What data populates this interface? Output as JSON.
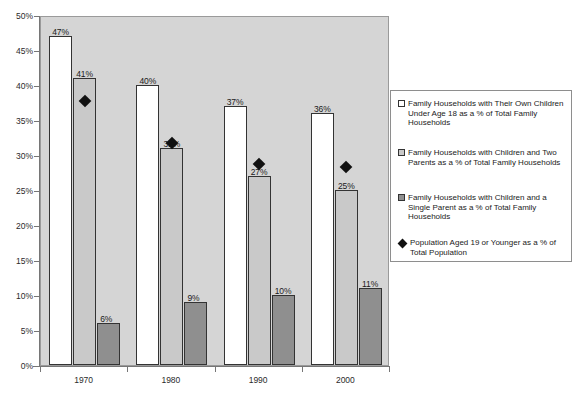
{
  "chart_data": {
    "type": "bar",
    "title": "",
    "subtitle": "",
    "xlabel": "",
    "ylabel": "",
    "categories": [
      "1970",
      "1980",
      "1990",
      "2000"
    ],
    "ylim": [
      0,
      50
    ],
    "y_tick_step": 5,
    "y_tick_labels": [
      "0%",
      "5%",
      "10%",
      "15%",
      "20%",
      "25%",
      "30%",
      "35%",
      "40%",
      "45%",
      "50%"
    ],
    "y_tick_values": [
      0,
      5,
      10,
      15,
      20,
      25,
      30,
      35,
      40,
      45,
      50
    ],
    "grid": false,
    "legend_position": "right",
    "plot_background": "#d5d5d5",
    "series": [
      {
        "name": "Family Households with Their Own Children Under Age 18 as a % of Total Family Households",
        "type": "bar",
        "marker": "white-square",
        "color": "#ffffff",
        "values": [
          47,
          40,
          37,
          36
        ],
        "data_labels": [
          "47%",
          "40%",
          "37%",
          "36%"
        ]
      },
      {
        "name": "Family Households with Children and Two Parents as a % of Total Family Households",
        "type": "bar",
        "marker": "light-gray-square",
        "color": "#c9c9c9",
        "values": [
          41,
          31,
          27,
          25
        ],
        "data_labels": [
          "41%",
          "31%",
          "27%",
          "25%"
        ]
      },
      {
        "name": "Family Households with Children and a Single Parent as a % of Total Family Households",
        "type": "bar",
        "marker": "dark-gray-square",
        "color": "#8f8f8f",
        "values": [
          6,
          9,
          10,
          11
        ],
        "data_labels": [
          "6%",
          "9%",
          "10%",
          "11%"
        ]
      },
      {
        "name": "Population Aged 19 or Younger as a % of Total Population",
        "type": "scatter",
        "marker": "black-diamond",
        "color": "#111111",
        "values": [
          38,
          32,
          29,
          28.6
        ],
        "data_labels": [
          "",
          "",
          "",
          ""
        ]
      }
    ]
  },
  "legend": {
    "entries": [
      {
        "marker": "white-square",
        "label": "Family Households with Their Own Children Under Age 18 as a % of Total Family Households"
      },
      {
        "marker": "light-gray-square",
        "label": "Family Households with Children and Two Parents as a % of Total Family Households"
      },
      {
        "marker": "dark-gray-square",
        "label": "Family Households with Children and a Single Parent as a % of Total Family Households"
      },
      {
        "marker": "black-diamond",
        "label": "Population Aged 19 or Younger as a % of Total Population"
      }
    ]
  }
}
